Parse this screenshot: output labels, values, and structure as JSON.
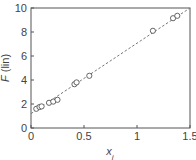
{
  "chart_data": {
    "type": "scatter",
    "title": "",
    "xlabel": "x_i",
    "ylabel": "F (lin)",
    "xlim": [
      0,
      1.5
    ],
    "ylim": [
      0,
      10
    ],
    "xticks": [
      0,
      0.5,
      1,
      1.5
    ],
    "xtick_labels": [
      "0",
      "0.5",
      "1",
      "1.5"
    ],
    "yticks": [
      0,
      2,
      4,
      6,
      8,
      10
    ],
    "ytick_labels": [
      "0",
      "2",
      "4",
      "6",
      "8",
      "10"
    ],
    "grid": false,
    "legend": null,
    "series": [
      {
        "name": "data",
        "marker": "open-circle",
        "x": [
          0.05,
          0.08,
          0.1,
          0.17,
          0.21,
          0.25,
          0.41,
          0.43,
          0.55,
          1.15,
          1.34,
          1.38
        ],
        "y": [
          1.6,
          1.75,
          1.8,
          2.1,
          2.2,
          2.35,
          3.65,
          3.8,
          4.35,
          8.1,
          9.15,
          9.35
        ]
      },
      {
        "name": "fit",
        "style": "dashed-line",
        "x": [
          0,
          1.5
        ],
        "y": [
          1.2,
          10.0
        ]
      }
    ],
    "colors": {
      "axis": "#555555",
      "marker": "#555555",
      "fit_line": "#777777",
      "text": "#444444"
    }
  }
}
